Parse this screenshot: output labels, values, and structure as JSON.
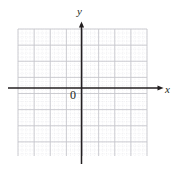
{
  "figure": {
    "kind": "cartesian-coordinate-grid",
    "background_color": "#ffffff"
  },
  "labels": {
    "y_axis": "y",
    "x_axis": "x",
    "origin": "0"
  },
  "chart_data": {
    "type": "scatter",
    "title": "",
    "subtitle": "",
    "xlabel": "x",
    "ylabel": "y",
    "origin_label": "0",
    "series": [
      {
        "name": "",
        "x": [],
        "y": []
      }
    ],
    "x": [],
    "values": [],
    "categories": [],
    "xlim": [
      -4,
      4
    ],
    "ylim": [
      -4,
      4
    ],
    "xticks": [
      -4,
      -3,
      -2,
      -1,
      0,
      1,
      2,
      3,
      4
    ],
    "yticks": [
      -4,
      -3,
      -2,
      -1,
      0,
      1,
      2,
      3,
      4
    ],
    "xtick_labels": [],
    "ytick_labels": [],
    "grid": true,
    "minor_grid": true,
    "minor_divisions_per_major": 4,
    "legend": null,
    "annotations": []
  },
  "geometry": {
    "grid_left": 18,
    "grid_right": 147,
    "grid_top": 29,
    "grid_bottom": 156,
    "origin_x": 81.5,
    "origin_y": 88.0,
    "major_step": 16.125,
    "minor_step": 4.03125,
    "x_axis_start": 8,
    "x_axis_end": 163,
    "y_axis_start": 22,
    "y_axis_end": 164
  },
  "colors": {
    "axis": "#231f20",
    "major_grid": "#c9c9cf",
    "minor_grid": "#dcdce2",
    "text": "#231f20",
    "background": "#ffffff"
  }
}
